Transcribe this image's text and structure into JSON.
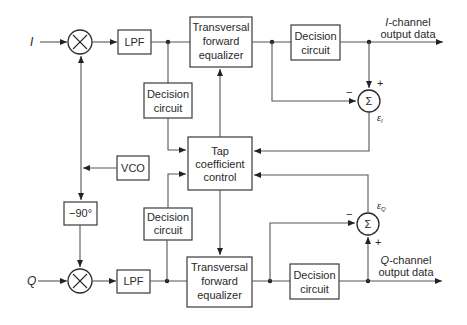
{
  "diagram": {
    "inputs": {
      "i_label": "I",
      "q_label": "Q"
    },
    "blocks": {
      "mixer_i_symbol": "×",
      "mixer_q_symbol": "×",
      "lpf_i": "LPF",
      "lpf_q": "LPF",
      "tfe_i": [
        "Transversal",
        "forward",
        "equalizer"
      ],
      "tfe_q": [
        "Transversal",
        "forward",
        "equalizer"
      ],
      "decision_left_top": [
        "Decision",
        "circuit"
      ],
      "decision_left_bottom": [
        "Decision",
        "circuit"
      ],
      "decision_i_out": [
        "Decision",
        "circuit"
      ],
      "decision_q_out": [
        "Decision",
        "circuit"
      ],
      "tap_control": [
        "Tap",
        "coefficient",
        "control"
      ],
      "vco": "VCO",
      "phase_shift": "−90°",
      "sum_i_symbol": "Σ",
      "sum_q_symbol": "Σ"
    },
    "outputs": {
      "i_output": [
        "I-channel",
        "output data"
      ],
      "i_output_italic": "I",
      "i_output_rest": "-channel",
      "q_output_italic": "Q",
      "q_output_rest": "-channel",
      "output_line2": "output data"
    },
    "signs": {
      "sum_i_plus": "+",
      "sum_i_minus": "−",
      "sum_q_plus": "+",
      "sum_q_minus": "−"
    },
    "error_labels": {
      "eps_i": "ε",
      "eps_i_sub": "I",
      "eps_q": "ε",
      "eps_q_sub": "Q"
    }
  }
}
